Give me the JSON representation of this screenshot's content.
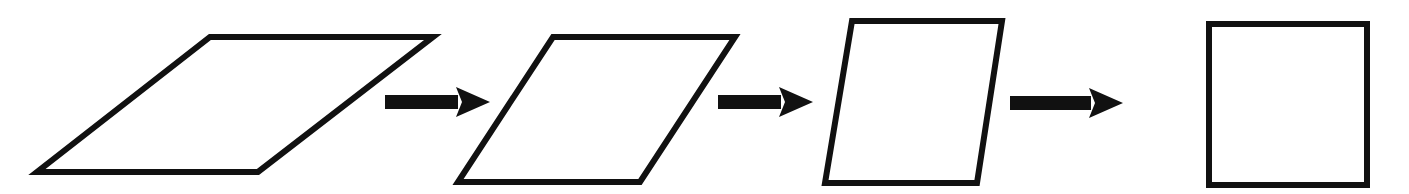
{
  "diagram": {
    "stroke_color": "#111111",
    "fill_color": "#ffffff",
    "background": "#ffffff",
    "shapes": [
      {
        "id": "parallelogram-1",
        "kind": "parallelogram",
        "points": [
          [
            210,
            37
          ],
          [
            433,
            37
          ],
          [
            258,
            172
          ],
          [
            37,
            172
          ]
        ]
      },
      {
        "id": "parallelogram-2",
        "kind": "parallelogram",
        "points": [
          [
            553,
            37
          ],
          [
            735,
            37
          ],
          [
            640,
            182
          ],
          [
            458,
            182
          ]
        ]
      },
      {
        "id": "parallelogram-3",
        "kind": "parallelogram",
        "points": [
          [
            852,
            21
          ],
          [
            1002,
            21
          ],
          [
            977,
            183
          ],
          [
            825,
            183
          ]
        ]
      },
      {
        "id": "square",
        "kind": "square",
        "points": [
          [
            1209,
            24
          ],
          [
            1367,
            24
          ],
          [
            1367,
            185
          ],
          [
            1209,
            185
          ]
        ]
      }
    ],
    "arrows": [
      {
        "id": "arrow-1",
        "x1": 385,
        "x2": 490,
        "y": 102,
        "direction": "right"
      },
      {
        "id": "arrow-2",
        "x1": 718,
        "x2": 813,
        "y": 102,
        "direction": "right"
      },
      {
        "id": "arrow-3",
        "x1": 1010,
        "x2": 1123,
        "y": 103,
        "direction": "right"
      }
    ]
  }
}
